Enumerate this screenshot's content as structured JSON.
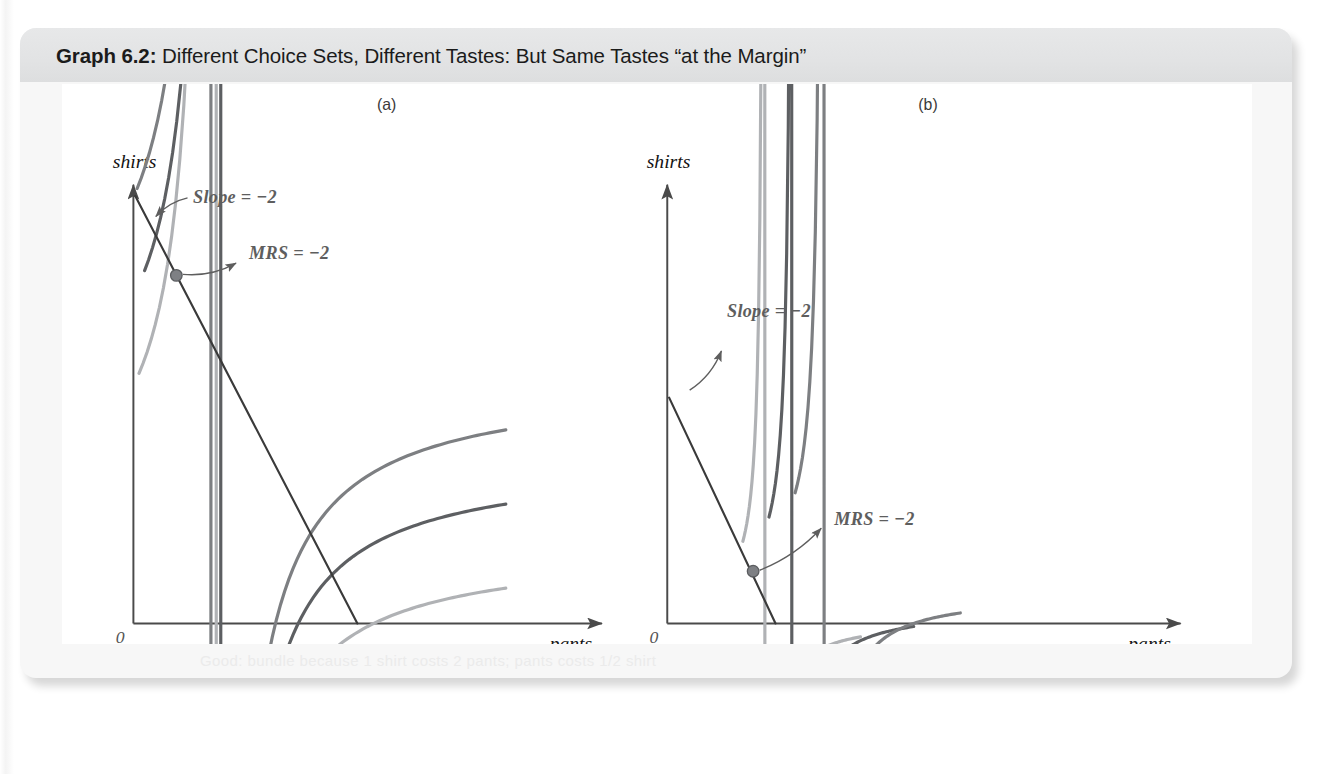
{
  "caption": {
    "label": "Graph 6.2:",
    "text": "Different Choice Sets, Different Tastes: But Same Tastes “at the Margin”"
  },
  "ghost_text": "Good: bundle because 1 shirt costs 2 pants; pants costs 1/2 shirt",
  "colors": {
    "axis": "#4a4a4a",
    "budget_line": "#3a3a3a",
    "curve_high": "#7d7f82",
    "curve_mid": "#5d5f62",
    "curve_low": "#b0b2b5",
    "tangency_dot": "#7e8084",
    "annotation": "#5e5e5e",
    "caption_band": "#e3e4e5",
    "card": "#f7f7f7"
  },
  "panels": [
    {
      "letter": "(a)",
      "letter_pos": {
        "x": 325,
        "y": 28
      },
      "ylabel": "shirts",
      "xlabel": "pants",
      "origin_label": "0",
      "axis": {
        "ox": 64,
        "oy": 578,
        "top_y": 108,
        "right_x": 566
      },
      "budget_line": {
        "from": {
          "x": 66,
          "y": 120
        },
        "to": {
          "x": 304,
          "y": 578
        },
        "slope_label": "Slope = −2",
        "slope_label_pos": {
          "x": 128,
          "y": 127
        },
        "arrow_from": {
          "x": 122,
          "y": 122
        },
        "arrow_to": {
          "x": 88,
          "y": 142
        }
      },
      "tangency": {
        "x": 110,
        "y": 205,
        "label": "MRS = −2",
        "label_pos": {
          "x": 188,
          "y": 188
        }
      },
      "curves": [
        {
          "name": "indifference-curve-high",
          "color": "#7d7f82",
          "start": {
            "x": 68,
            "y": 112
          },
          "k": 17000,
          "x_end": 463,
          "y_asym": 316
        },
        {
          "name": "indifference-curve-mid",
          "color": "#5d5f62",
          "start": {
            "x": 76,
            "y": 200
          },
          "k": 15500,
          "x_end": 463,
          "y_asym": 400
        },
        {
          "name": "indifference-curve-low",
          "color": "#b0b2b5",
          "start": {
            "x": 70,
            "y": 310
          },
          "k": 14500,
          "x_end": 463,
          "y_asym": 494
        }
      ]
    },
    {
      "letter": "(b)",
      "letter_pos": {
        "x": 905,
        "y": 28
      },
      "ylabel": "shirts",
      "xlabel": "pants",
      "origin_label": "0",
      "axis": {
        "ox": 636,
        "oy": 578,
        "top_y": 108,
        "right_x": 1186
      },
      "budget_line": {
        "from": {
          "x": 638,
          "y": 336
        },
        "to": {
          "x": 752,
          "y": 578
        },
        "slope_label": "Slope = −2",
        "slope_label_pos": {
          "x": 700,
          "y": 250
        },
        "arrow_from": {
          "x": 660,
          "y": 328
        },
        "arrow_to": {
          "x": 694,
          "y": 286
        }
      },
      "tangency": {
        "x": 728,
        "y": 522,
        "label": "MRS = −2",
        "label_pos": {
          "x": 815,
          "y": 472
        }
      },
      "curves": [
        {
          "name": "indifference-curve-high",
          "color": "#7d7f82",
          "start": {
            "x": 773,
            "y": 438
          },
          "k": 3200,
          "x_end": 950,
          "y_asym": 545
        },
        {
          "name": "indifference-curve-mid",
          "color": "#5d5f62",
          "start": {
            "x": 745,
            "y": 464
          },
          "k": 2500,
          "x_end": 900,
          "y_asym": 562
        },
        {
          "name": "indifference-curve-low",
          "color": "#b0b2b5",
          "start": {
            "x": 717,
            "y": 490
          },
          "k": 1900,
          "x_end": 843,
          "y_asym": 574
        }
      ]
    }
  ],
  "chart_data": {
    "type": "line",
    "title": "Different Choice Sets, Different Tastes: But Same Tastes “at the Margin”",
    "xlabel": "pants",
    "ylabel": "shirts",
    "grid": false,
    "legend": "none",
    "subplots": [
      {
        "panel": "(a)",
        "description": "Three convex indifference curves for a consumer with relatively flat tastes, plus a budget line of slope -2 tangent to the highest curve near the vertical axis.",
        "annotations": [
          "Slope = −2",
          "MRS = −2"
        ],
        "budget_line_slope": -2,
        "mrs_at_optimum": -2,
        "series": [
          {
            "name": "budget line",
            "type": "line",
            "x": [
              0.03,
              1.9
            ],
            "y": [
              9.6,
              0.0
            ]
          },
          {
            "name": "indifference curve U3 (highest)",
            "type": "curve",
            "x": [
              0.05,
              0.5,
              1.0,
              1.75,
              2.5,
              3.2
            ],
            "y": [
              9.9,
              5.1,
              3.6,
              2.9,
              2.7,
              2.6
            ]
          },
          {
            "name": "indifference curve U2 (middle)",
            "type": "curve",
            "x": [
              0.12,
              0.6,
              1.2,
              2.0,
              2.7,
              3.2
            ],
            "y": [
              8.1,
              3.9,
              2.5,
              1.8,
              1.6,
              1.55
            ]
          },
          {
            "name": "indifference curve U1 (lowest)",
            "type": "curve",
            "x": [
              0.06,
              0.6,
              1.3,
              2.1,
              2.8,
              3.2
            ],
            "y": [
              5.8,
              2.3,
              1.3,
              0.95,
              0.8,
              0.78
            ]
          },
          {
            "name": "tangency point",
            "type": "point",
            "x": [
              0.37
            ],
            "y": [
              8.1
            ]
          }
        ],
        "xlim": [
          0,
          4
        ],
        "ylim": [
          0,
          10
        ]
      },
      {
        "panel": "(b)",
        "description": "Three steep convex indifference curves for a consumer with different tastes, plus a budget line of slope -2 tangent to the middle curve; MRS at the tangency equals -2.",
        "annotations": [
          "Slope = −2",
          "MRS = −2"
        ],
        "budget_line_slope": -2,
        "mrs_at_optimum": -2,
        "series": [
          {
            "name": "budget line",
            "type": "line",
            "x": [
              0.01,
              0.84
            ],
            "y": [
              5.2,
              0.0
            ]
          },
          {
            "name": "indifference curve U3 (highest)",
            "type": "curve",
            "x": [
              1.0,
              1.15,
              1.4,
              2.0,
              2.7,
              3.4
            ],
            "y": [
              3.0,
              2.0,
              1.3,
              0.85,
              0.72,
              0.7
            ]
          },
          {
            "name": "indifference curve U2 (middle)",
            "type": "curve",
            "x": [
              0.8,
              0.95,
              1.2,
              1.75,
              2.4,
              2.9
            ],
            "y": [
              2.45,
              1.6,
              1.05,
              0.6,
              0.42,
              0.37
            ]
          },
          {
            "name": "indifference curve U1 (lowest)",
            "type": "curve",
            "x": [
              0.6,
              0.72,
              0.95,
              1.3,
              1.7,
              2.1
            ],
            "y": [
              1.9,
              1.2,
              0.7,
              0.38,
              0.2,
              0.12
            ]
          },
          {
            "name": "tangency point",
            "type": "point",
            "x": [
              0.67
            ],
            "y": [
              1.2
            ]
          }
        ],
        "xlim": [
          0,
          4
        ],
        "ylim": [
          0,
          10
        ]
      }
    ]
  }
}
